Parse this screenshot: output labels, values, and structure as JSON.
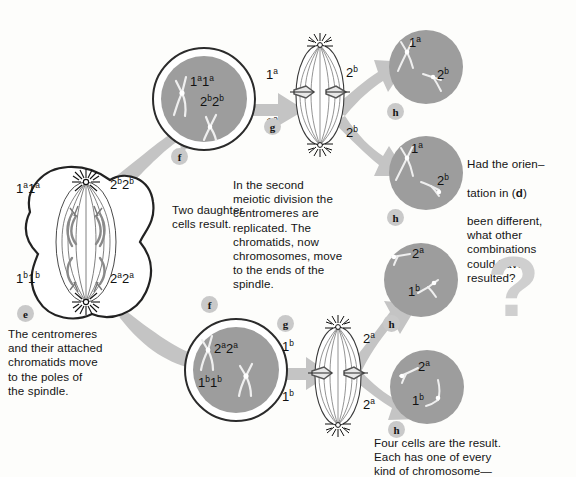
{
  "figure": {
    "background_color": "#fdfdfb",
    "nucleus_color": "#9d9d9d",
    "arrow_color": "#c2c2c2",
    "badge_color": "#c9c9c9",
    "question_mark": "?"
  },
  "stages": {
    "e": {
      "letter": "e",
      "caption": "The centromeres\nand their attached\nchromatids move\nto the poles of\nthe spindle.",
      "labels": {
        "top_left": "1a1a",
        "top_right": "2b2b",
        "bottom_left": "1b1b",
        "bottom_right": "2a2a"
      }
    },
    "f_top": {
      "letter": "f",
      "labels": {
        "first": "1a1a",
        "second": "2b2b"
      }
    },
    "f_bottom": {
      "letter": "f",
      "labels": {
        "first": "2a2a",
        "second": "1b1b"
      }
    },
    "f_caption": "Two daughter\ncells result.",
    "g_top": {
      "letter": "g",
      "labels": {
        "top_left": "1a",
        "top_right": "2b",
        "bottom_left": "1a",
        "bottom_right": "2b"
      }
    },
    "g_bottom": {
      "letter": "g",
      "labels": {
        "top_left": "1b",
        "top_right": "2a",
        "bottom_left": "1b",
        "bottom_right": "2a"
      }
    },
    "g_caption": "In the second\nmeiotic division the\ncentromeres are\nreplicated. The\nchromatids, now\nchromosomes, move\nto the ends of the\nspindle.",
    "h_cells": [
      {
        "letter": "h",
        "label_top": "1a",
        "label_bottom": "2b"
      },
      {
        "letter": "h",
        "label_top": "1a",
        "label_bottom": "2b"
      },
      {
        "letter": "h",
        "label_top": "2a",
        "label_bottom": "1b"
      },
      {
        "letter": "h",
        "label_top": "2a",
        "label_bottom": "1b"
      }
    ],
    "h_caption": "Four cells are the result.\nEach has one of every\nkind of chromosome—"
  },
  "question_panel": {
    "line1": "Had the orien–",
    "line2_pre": "tation in (",
    "line2_bold": "d",
    "line2_post": ") ",
    "rest": "been different,\nwhat other\ncombinations\ncould have\nresulted?"
  }
}
